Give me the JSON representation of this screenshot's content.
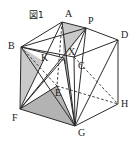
{
  "figure": {
    "tag": "図1",
    "tag_pos": {
      "x": 29,
      "y": 11
    },
    "caption": "Cube ABCD-EFGH with point P on edge AD, interior points X and K, shaded triangles AXG and FEG"
  },
  "colors": {
    "stroke": "#2b2b2b",
    "shade_light": "#c9c9c9",
    "shade_dark": "#b3b3b3",
    "background": "#ffffff",
    "label_text": "#1a1a1a"
  },
  "vertices": [
    {
      "id": "A",
      "label": "A",
      "x": 62,
      "y": 22,
      "label_x": 65,
      "label_y": 9
    },
    {
      "id": "P",
      "label": "P",
      "x": 86,
      "y": 28,
      "label_x": 88,
      "label_y": 16
    },
    {
      "id": "D",
      "label": "D",
      "x": 118,
      "y": 40,
      "label_x": 121,
      "label_y": 30
    },
    {
      "id": "B",
      "label": "B",
      "x": 21,
      "y": 47,
      "label_x": 8,
      "label_y": 41
    },
    {
      "id": "C",
      "label": "C",
      "x": 74,
      "y": 57,
      "label_x": 78,
      "label_y": 61
    },
    {
      "id": "X",
      "label": "X",
      "x": 64,
      "y": 58,
      "label_x": 68,
      "label_y": 47
    },
    {
      "id": "K",
      "label": "K",
      "x": 43,
      "y": 61,
      "label_x": 41,
      "label_y": 53
    },
    {
      "id": "E",
      "label": "E",
      "x": 57,
      "y": 86,
      "label_x": 55,
      "label_y": 88
    },
    {
      "id": "H",
      "label": "H",
      "x": 118,
      "y": 104,
      "label_x": 121,
      "label_y": 99
    },
    {
      "id": "F",
      "label": "F",
      "x": 20,
      "y": 109,
      "label_x": 12,
      "label_y": 113
    },
    {
      "id": "G",
      "label": "G",
      "x": 75,
      "y": 126,
      "label_x": 78,
      "label_y": 128
    }
  ],
  "shaded_faces": [
    {
      "name": "triangle-A-P-X",
      "points": "62,22 86,28 64,58",
      "tone": "shade_light"
    },
    {
      "name": "triangle-A-X-G",
      "points": "62,22 64,58 75,126",
      "tone": "shade_dark"
    },
    {
      "name": "quad-F-E-G",
      "points": "20,109 57,86 75,126",
      "tone": "shade_dark"
    },
    {
      "name": "triangle-B-K-F",
      "points": "21,47 43,61 20,109",
      "tone": "shade_light"
    }
  ],
  "solid_edges": [
    {
      "name": "edge-A-B",
      "from": "A",
      "to": "B"
    },
    {
      "name": "edge-A-P",
      "from": "A",
      "to": "P"
    },
    {
      "name": "edge-P-D",
      "from": "P",
      "to": "D"
    },
    {
      "name": "edge-B-C",
      "from": "B",
      "to": "C"
    },
    {
      "name": "edge-C-D",
      "from": "C",
      "to": "D"
    },
    {
      "name": "edge-B-F",
      "from": "B",
      "to": "F"
    },
    {
      "name": "edge-C-G",
      "from": "C",
      "to": "G"
    },
    {
      "name": "edge-D-H",
      "from": "D",
      "to": "H"
    },
    {
      "name": "edge-F-G",
      "from": "F",
      "to": "G"
    },
    {
      "name": "edge-G-H",
      "from": "G",
      "to": "H"
    },
    {
      "name": "diagonal-A-G",
      "from": "A",
      "to": "G"
    },
    {
      "name": "diagonal-A-F",
      "from": "A",
      "to": "F"
    },
    {
      "name": "diagonal-B-G",
      "from": "B",
      "to": "G"
    },
    {
      "name": "diagonal-B-P",
      "from": "B",
      "to": "P"
    },
    {
      "name": "diagonal-B-X",
      "from": "B",
      "to": "X"
    },
    {
      "name": "diagonal-P-F",
      "from": "P",
      "to": "F"
    },
    {
      "name": "diagonal-P-G",
      "from": "P",
      "to": "G"
    },
    {
      "name": "diagonal-F-X",
      "from": "F",
      "to": "X"
    },
    {
      "name": "diagonal-X-G",
      "from": "X",
      "to": "G"
    },
    {
      "name": "diagonal-E-F",
      "from": "E",
      "to": "F"
    },
    {
      "name": "diagonal-E-G",
      "from": "E",
      "to": "G"
    },
    {
      "name": "diagonal-D-G",
      "from": "D",
      "to": "G"
    },
    {
      "name": "edge-P-C",
      "from": "P",
      "to": "C"
    }
  ],
  "dashed_edges": [
    {
      "name": "hidden-edge-A-E",
      "from": "A",
      "to": "E"
    },
    {
      "name": "hidden-edge-E-H",
      "from": "E",
      "to": "H"
    },
    {
      "name": "hidden-edge-C-H",
      "from": "C",
      "to": "H"
    },
    {
      "name": "hidden-edge-B-E",
      "from": "B",
      "to": "E"
    }
  ],
  "marks": [
    {
      "name": "right-angle-mark-at-X",
      "x": 61,
      "y": 60,
      "size": 4
    }
  ]
}
